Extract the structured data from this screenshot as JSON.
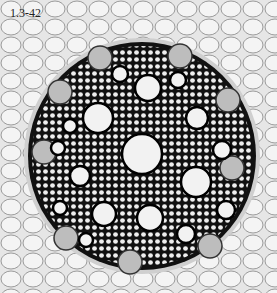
{
  "figure": {
    "label": "1.3-42",
    "colors": {
      "background": "#e8e8e8",
      "cells": "#111111",
      "lumen": "#f2f2f2"
    }
  },
  "vessels": [
    {
      "cx": 142,
      "cy": 154,
      "r": 20
    },
    {
      "cx": 98,
      "cy": 118,
      "r": 15
    },
    {
      "cx": 148,
      "cy": 88,
      "r": 13
    },
    {
      "cx": 197,
      "cy": 118,
      "r": 11
    },
    {
      "cx": 196,
      "cy": 182,
      "r": 15
    },
    {
      "cx": 150,
      "cy": 218,
      "r": 13
    },
    {
      "cx": 104,
      "cy": 214,
      "r": 12
    },
    {
      "cx": 80,
      "cy": 176,
      "r": 10
    },
    {
      "cx": 120,
      "cy": 74,
      "r": 8
    },
    {
      "cx": 178,
      "cy": 80,
      "r": 8
    },
    {
      "cx": 222,
      "cy": 150,
      "r": 9
    },
    {
      "cx": 226,
      "cy": 210,
      "r": 9
    },
    {
      "cx": 186,
      "cy": 234,
      "r": 9
    },
    {
      "cx": 70,
      "cy": 126,
      "r": 7
    },
    {
      "cx": 58,
      "cy": 148,
      "r": 7
    },
    {
      "cx": 86,
      "cy": 240,
      "r": 7
    },
    {
      "cx": 60,
      "cy": 208,
      "r": 7
    }
  ],
  "phloem": [
    {
      "cx": 100,
      "cy": 58
    },
    {
      "cx": 180,
      "cy": 56
    },
    {
      "cx": 228,
      "cy": 100
    },
    {
      "cx": 232,
      "cy": 168
    },
    {
      "cx": 210,
      "cy": 246
    },
    {
      "cx": 130,
      "cy": 262
    },
    {
      "cx": 66,
      "cy": 238
    },
    {
      "cx": 44,
      "cy": 152
    },
    {
      "cx": 60,
      "cy": 92
    }
  ]
}
